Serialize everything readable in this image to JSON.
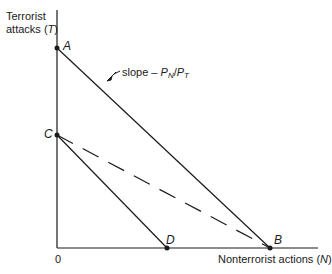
{
  "diagram": {
    "y_axis_label_line1": "Terrorist",
    "y_axis_label_line2_prefix": "attacks (",
    "y_axis_label_var": "T",
    "y_axis_label_suffix": ")",
    "x_axis_label_prefix": "Nonterrorist actions (",
    "x_axis_label_var": "N",
    "x_axis_label_suffix": ")",
    "origin_label": "0",
    "slope_label_prefix": "slope – ",
    "slope_num": "P",
    "slope_num_sub": "N",
    "slope_sep": "/",
    "slope_den": "P",
    "slope_den_sub": "T",
    "points": [
      {
        "label": "A",
        "x": 57,
        "y": 48
      },
      {
        "label": "B",
        "x": 270,
        "y": 248
      },
      {
        "label": "C",
        "x": 57,
        "y": 135
      },
      {
        "label": "D",
        "x": 167,
        "y": 248
      }
    ],
    "lines": [
      {
        "from": "A",
        "to": "B",
        "style": "solid"
      },
      {
        "from": "C",
        "to": "D",
        "style": "solid"
      },
      {
        "from": "C",
        "to": "B",
        "style": "dashed"
      }
    ],
    "colors": {
      "ink": "#1a1a1a",
      "background": "#ffffff"
    }
  }
}
